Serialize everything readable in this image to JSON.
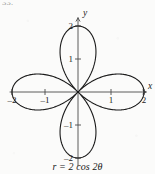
{
  "problem_number": "33.",
  "caption": "r = 2 cos 2θ",
  "chart_data": {
    "type": "line",
    "subtype": "polar-rose",
    "title": "",
    "equation": "r = 2 cos 2θ",
    "equation_parts": {
      "lhs": "r",
      "equals": "=",
      "amplitude": 2,
      "function": "cos",
      "frequency": 2,
      "variable": "θ"
    },
    "xlabel": "x",
    "ylabel": "y",
    "xlim": [
      -2.35,
      2.35
    ],
    "ylim": [
      -2.35,
      2.35
    ],
    "xticks": [
      -2,
      -1,
      1,
      2
    ],
    "yticks": [
      -2,
      -1,
      1,
      2
    ],
    "xtick_labels": [
      "–2",
      "–1",
      "1",
      "2"
    ],
    "ytick_labels": [
      "–2",
      "–1",
      "1",
      "2"
    ],
    "grid": false,
    "legend": false,
    "petal_count": 4,
    "petal_max_radius": 2,
    "petal_axis_angles_deg": [
      0,
      90,
      180,
      270
    ],
    "tangent_angles_deg": [
      45,
      135,
      225,
      315
    ],
    "origin_label": "",
    "curve_color": "#1a1a1a",
    "axis_color": "#4a4a4a",
    "series": [
      {
        "name": "r = 2 cos 2θ",
        "theta_deg": [
          0,
          15,
          30,
          45,
          60,
          75,
          90,
          105,
          120,
          135,
          150,
          165,
          180,
          195,
          210,
          225,
          240,
          255,
          270,
          285,
          300,
          315,
          330,
          345,
          360
        ],
        "r": [
          2.0,
          1.732,
          1.0,
          0.0,
          -1.0,
          -1.732,
          -2.0,
          -1.732,
          -1.0,
          0.0,
          1.0,
          1.732,
          2.0,
          1.732,
          1.0,
          0.0,
          -1.0,
          -1.732,
          -2.0,
          -1.732,
          -1.0,
          0.0,
          1.0,
          1.732,
          2.0
        ]
      }
    ]
  },
  "geometry": {
    "origin_x": 78,
    "origin_y": 92,
    "unit_px": 33,
    "axis_half_len_x": 68,
    "axis_half_len_y": 74,
    "tick_half_len": 3,
    "curve_stroke_width": 1.1,
    "axis_stroke_width": 0.9
  },
  "labels": {
    "x_axis_name": "x",
    "y_axis_name": "y"
  }
}
